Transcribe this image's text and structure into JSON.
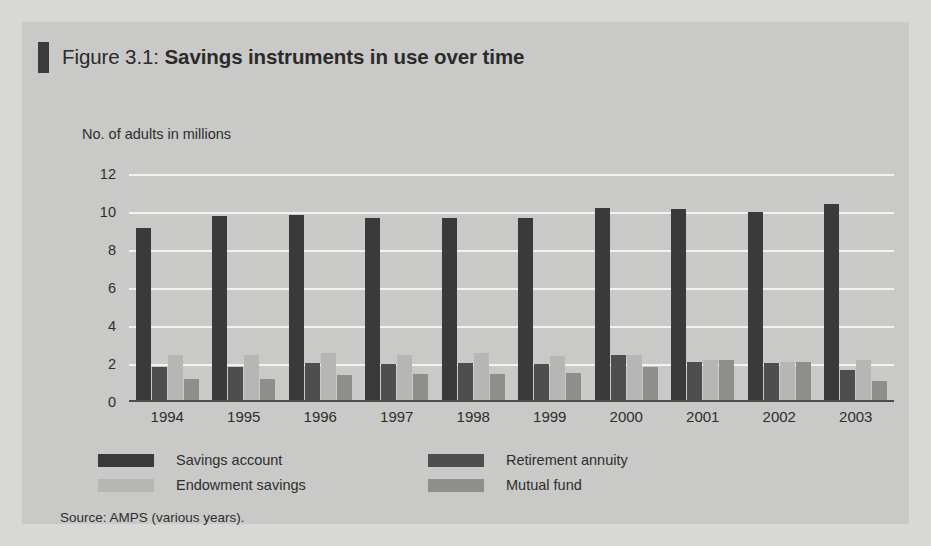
{
  "figure": {
    "label": "Figure 3.1:",
    "name": "Savings instruments in use over time",
    "source": "Source: AMPS (various years)."
  },
  "colors": {
    "panel_background": "#c9c9c7",
    "page_background": "#d8d8d6",
    "gridline": "#f2f2f0",
    "axis": "#4c4c4c",
    "savings_account": "#3a3a3a",
    "retirement_annuity": "#4e4e4e",
    "endowment_savings": "#b6b6b4",
    "mutual_fund": "#8e8e8c",
    "title_mark": "#3b3b3b",
    "text": "#2e2e2e"
  },
  "legend": {
    "position": "below-axis",
    "items": [
      {
        "label": "Savings account",
        "color": "#3a3a3a"
      },
      {
        "label": "Retirement annuity",
        "color": "#4e4e4e"
      },
      {
        "label": "Endowment savings",
        "color": "#b6b6b4"
      },
      {
        "label": "Mutual fund",
        "color": "#8e8e8c"
      }
    ]
  },
  "chart_data": {
    "type": "bar",
    "title": "Figure 3.1: Savings instruments in use over time",
    "subtitle": "",
    "xlabel": "",
    "ylabel": "No. of adults in millions",
    "ylim": [
      0,
      12
    ],
    "yticks": [
      0,
      2,
      4,
      6,
      8,
      10,
      12
    ],
    "ytick_labels": [
      "0",
      "2",
      "4",
      "6",
      "8",
      "10",
      "12"
    ],
    "grid": true,
    "grid_axis": "y",
    "legend_position": "bottom-left",
    "categories": [
      "1994",
      "1995",
      "1996",
      "1997",
      "1998",
      "1999",
      "2000",
      "2001",
      "2002",
      "2003"
    ],
    "series": [
      {
        "name": "Savings account",
        "color": "#3a3a3a",
        "values": [
          9.05,
          9.7,
          9.75,
          9.6,
          9.6,
          9.6,
          10.1,
          10.05,
          9.9,
          10.3
        ]
      },
      {
        "name": "Retirement annuity",
        "color": "#4e4e4e",
        "values": [
          1.75,
          1.75,
          1.95,
          1.9,
          1.95,
          1.9,
          2.35,
          2.0,
          1.95,
          1.6
        ]
      },
      {
        "name": "Endowment savings",
        "color": "#b6b6b4",
        "values": [
          2.35,
          2.35,
          2.45,
          2.35,
          2.45,
          2.3,
          2.35,
          2.1,
          2.0,
          2.1
        ]
      },
      {
        "name": "Mutual fund",
        "color": "#8e8e8c",
        "values": [
          1.1,
          1.1,
          1.3,
          1.35,
          1.35,
          1.4,
          1.75,
          2.1,
          2.0,
          1.0
        ]
      }
    ]
  }
}
